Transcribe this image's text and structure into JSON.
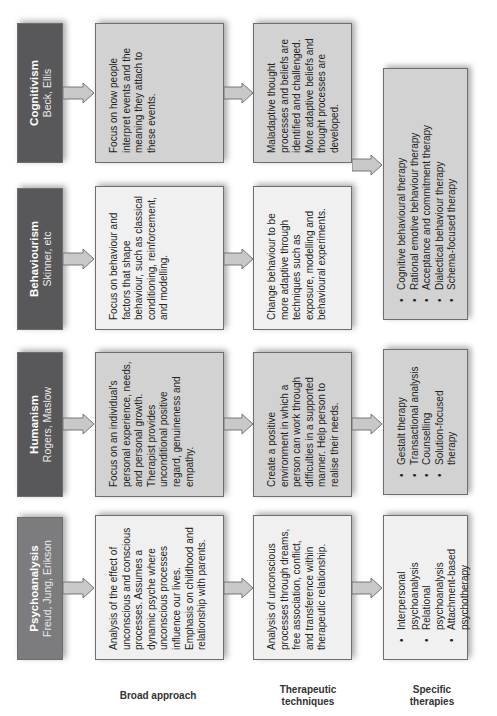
{
  "columns": [
    {
      "title": "Cognitivism",
      "authors": "Beck, Ellis",
      "broad_approach": "Focus on how people interpret events and the meaning they attach to these events.",
      "therapeutic_techniques": "Maladaptive thought processes and beliefs are identified and challenged. More adaptive beliefs and thought processes are developed."
    },
    {
      "title": "Behaviourism",
      "authors": "Skinner, etc",
      "broad_approach": "Focus on behaviour and factors that shape behaviour, such as classical conditioning, reinforcement, and modelling.",
      "therapeutic_techniques": "Change behaviour to be more adaptive through techniques such as exposure, modelling and behavioural experiments."
    },
    {
      "title": "Humanism",
      "authors": "Rogers, Maslow",
      "broad_approach": "Focus on an individual's personal experience, needs, and personal growth. Therapist provides unconditional positive regard, genuineness and empathy.",
      "therapeutic_techniques": "Create a positive environment in which a person can work through difficulties in a supported manner. Help person to realise their needs."
    },
    {
      "title": "Psychoanalysis",
      "authors": "Freud, Jung, Erikson",
      "broad_approach": "Analysis of the effect of unconscious and conscious processes. Assumes a dynamic psyche where unconscious processes influence our lives. Emphasis on childhood and relationship with parents.",
      "therapeutic_techniques": "Analysis of unconscious processes through dreams, free association, conflict, and transference within therapeutic relationship."
    }
  ],
  "specific_therapies": {
    "cognitive_behavioural": [
      "Cognitive behavioural therapy",
      "Rational emotive behaviour therapy",
      "Acceptance and commitment therapy",
      "Dialectical behaviour therapy",
      "Schema-focused therapy"
    ],
    "humanism": [
      "Gestalt therapy",
      "Transactional analysis",
      "Counselling",
      "Solution-focused therapy"
    ],
    "psychoanalysis": [
      "Interpersonal psychoanalysis",
      "Relational psychoanalysis",
      "Attachment-based psychotherapy"
    ]
  },
  "row_labels": {
    "broad": "Broad approach",
    "techniques": "Therapeutic techniques",
    "specific": "Specific therapies"
  },
  "colors": {
    "header_dark": "#58585a",
    "header_psycho": "#7c7c7e",
    "box_light": "#f0f0f0",
    "box_grey": "#d2d2d2",
    "arrow_fill": "#c8c8c8"
  }
}
